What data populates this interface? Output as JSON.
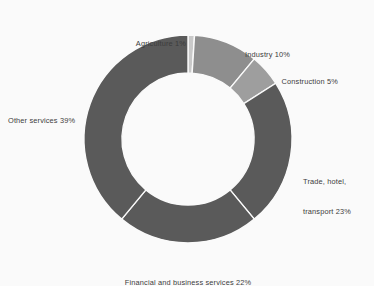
{
  "chart_data": {
    "type": "pie",
    "variant": "donut",
    "title": "",
    "subtitle": "",
    "xlabel": "",
    "ylabel": "",
    "unit": "%",
    "total": 100,
    "legend_position": "none",
    "grid": false,
    "background_color": "#fafafa",
    "label_color": "#3c3c3c",
    "separator_color": "#fafafa",
    "start_angle_deg": 0,
    "direction": "clockwise",
    "inner_radius_ratio": 0.635,
    "categories": [
      "Agriculture",
      "Industry",
      "Construction",
      "Trade, hotel, transport",
      "Financial and business services",
      "Other services"
    ],
    "values": [
      1,
      10,
      5,
      23,
      22,
      39
    ],
    "slices": [
      {
        "name": "Agriculture",
        "value": 1,
        "label": "Agriculture 1%",
        "label_lines": [
          "Agriculture 1%"
        ],
        "color": "#c9c9c9"
      },
      {
        "name": "Industry",
        "value": 10,
        "label": "Industry 10%",
        "label_lines": [
          "Industry 10%"
        ],
        "color": "#8e8e8e"
      },
      {
        "name": "Construction",
        "value": 5,
        "label": "Construction 5%",
        "label_lines": [
          "Construction 5%"
        ],
        "color": "#9e9e9e"
      },
      {
        "name": "Trade, hotel, transport",
        "value": 23,
        "label": "Trade, hotel, transport 23%",
        "label_lines": [
          "Trade, hotel,",
          "transport 23%"
        ],
        "color": "#5a5a5a"
      },
      {
        "name": "Financial and business services",
        "value": 22,
        "label": "Financial and business services 22%",
        "label_lines": [
          "Financial and business services 22%"
        ],
        "color": "#5a5a5a"
      },
      {
        "name": "Other services",
        "value": 39,
        "label": "Other services 39%",
        "label_lines": [
          "Other services 39%"
        ],
        "color": "#5a5a5a"
      }
    ]
  }
}
